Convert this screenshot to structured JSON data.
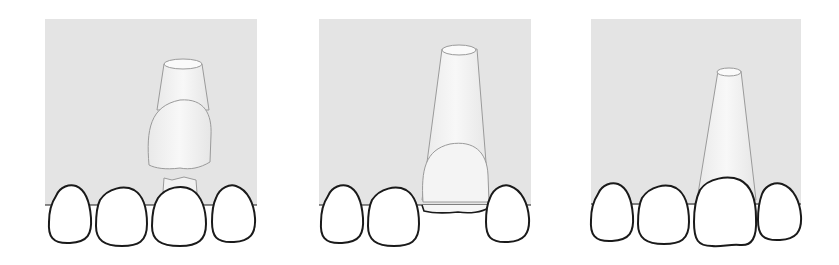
{
  "figure": {
    "title": "Crown placement onto post (three steps)",
    "colors": {
      "background": "#ffffff",
      "panel": "#e4e4e4",
      "tooth_fill": "#ffffff",
      "tooth_stroke": "#1a1a1a",
      "ghost_stroke": "#9a9a9a",
      "ghost_fill": "#f1f1f1"
    },
    "panels": [
      {
        "id": "step-1",
        "label": "Crown above post, prepared stump visible"
      },
      {
        "id": "step-2",
        "label": "Crown sliding down along post"
      },
      {
        "id": "step-3",
        "label": "Crown seated in dental arch"
      }
    ]
  }
}
